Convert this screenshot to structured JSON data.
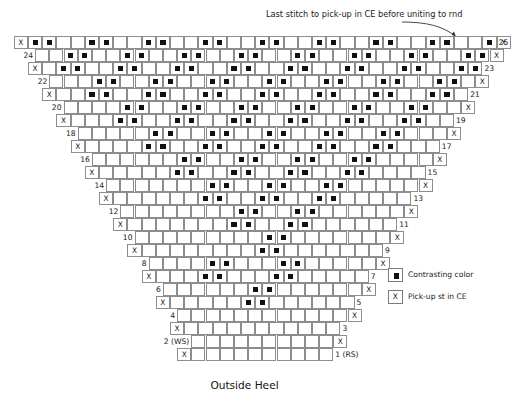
{
  "annotation": {
    "text": "Last stitch to pick-up in CE before uniting to rnd",
    "arrow_icon": "curved-arrow-icon"
  },
  "footer": {
    "label": "Outside Heel"
  },
  "legend": {
    "items": [
      {
        "symbol": "filled-square",
        "label": "Contrasting color"
      },
      {
        "symbol": "X",
        "label": "Pick-up st in CE"
      }
    ]
  },
  "colors": {
    "grid_line": "#8d8d8d",
    "dot": "#111111",
    "background": "#ffffff",
    "text": "#1a1a1a"
  },
  "chart_data": {
    "type": "table",
    "title": "Outside Heel",
    "rows": 25,
    "columns_top": 33,
    "cell_width": 14.2,
    "cell_height": 13,
    "row_side_labels": {
      "left_even": [
        24,
        22,
        20,
        18,
        16,
        14,
        12,
        10,
        8,
        6,
        4,
        "2 (WS)"
      ],
      "right_odd": [
        25,
        23,
        21,
        19,
        17,
        15,
        13,
        11,
        9,
        7,
        5,
        3,
        "1 (RS)"
      ]
    },
    "x_marks": {
      "left_rows": [
        25,
        23,
        21,
        19,
        17,
        15,
        13,
        11,
        9,
        7,
        5,
        3,
        1
      ],
      "right_rows": [
        25,
        24,
        22,
        20,
        18,
        16,
        14,
        12,
        10,
        8,
        6,
        4,
        2
      ]
    },
    "pattern": "chevron repeat, period 7 columns, pairs of dots shifting one column per two rows",
    "rows_data": [
      {
        "row": 25,
        "left_label": "",
        "right_label": "25",
        "x_left": true,
        "x_right": true,
        "width": 33,
        "dots": [
          0,
          1,
          4,
          5,
          8,
          9,
          12,
          13,
          16,
          17,
          20,
          21,
          24,
          25,
          28,
          29,
          32
        ]
      },
      {
        "row": 24,
        "left_label": "24",
        "right_label": "",
        "x_left": false,
        "x_right": true,
        "width": 32,
        "dots": [
          2,
          3,
          6,
          7,
          10,
          11,
          14,
          15,
          18,
          19,
          22,
          23,
          26,
          27,
          30,
          31
        ]
      },
      {
        "row": 23,
        "left_label": "",
        "right_label": "23",
        "x_left": true,
        "x_right": false,
        "width": 31,
        "dots": [
          1,
          2,
          5,
          6,
          9,
          10,
          13,
          14,
          17,
          18,
          21,
          22,
          25,
          26,
          29,
          30
        ]
      },
      {
        "row": 22,
        "left_label": "22",
        "right_label": "",
        "x_left": false,
        "x_right": true,
        "width": 30,
        "dots": [
          3,
          4,
          7,
          8,
          11,
          12,
          15,
          16,
          19,
          20,
          23,
          24,
          27,
          28
        ]
      },
      {
        "row": 21,
        "left_label": "",
        "right_label": "21",
        "x_left": true,
        "x_right": false,
        "width": 29,
        "dots": [
          2,
          3,
          6,
          7,
          10,
          11,
          14,
          15,
          18,
          19,
          22,
          23,
          26,
          27
        ]
      },
      {
        "row": 20,
        "left_label": "20",
        "right_label": "",
        "x_left": false,
        "x_right": true,
        "width": 28,
        "dots": [
          4,
          5,
          8,
          9,
          12,
          13,
          16,
          17,
          20,
          21,
          24,
          25
        ]
      },
      {
        "row": 19,
        "left_label": "",
        "right_label": "19",
        "x_left": true,
        "x_right": false,
        "width": 27,
        "dots": [
          3,
          4,
          7,
          8,
          11,
          12,
          15,
          16,
          19,
          20,
          23,
          24
        ]
      },
      {
        "row": 18,
        "left_label": "18",
        "right_label": "",
        "x_left": false,
        "x_right": true,
        "width": 26,
        "dots": [
          5,
          6,
          9,
          10,
          13,
          14,
          17,
          18,
          21,
          22
        ]
      },
      {
        "row": 17,
        "left_label": "",
        "right_label": "17",
        "x_left": true,
        "x_right": false,
        "width": 25,
        "dots": [
          4,
          5,
          8,
          9,
          12,
          13,
          16,
          17,
          20,
          21
        ]
      },
      {
        "row": 16,
        "left_label": "16",
        "right_label": "",
        "x_left": false,
        "x_right": true,
        "width": 24,
        "dots": [
          6,
          7,
          10,
          11,
          14,
          15,
          18,
          19
        ]
      },
      {
        "row": 15,
        "left_label": "",
        "right_label": "15",
        "x_left": true,
        "x_right": false,
        "width": 23,
        "dots": [
          5,
          6,
          9,
          10,
          13,
          14,
          17,
          18
        ]
      },
      {
        "row": 14,
        "left_label": "14",
        "right_label": "",
        "x_left": false,
        "x_right": true,
        "width": 22,
        "dots": [
          7,
          8,
          11,
          12,
          15,
          16
        ]
      },
      {
        "row": 13,
        "left_label": "",
        "right_label": "13",
        "x_left": true,
        "x_right": false,
        "width": 21,
        "dots": [
          6,
          7,
          10,
          11,
          14,
          15
        ]
      },
      {
        "row": 12,
        "left_label": "12",
        "right_label": "",
        "x_left": false,
        "x_right": true,
        "width": 20,
        "dots": [
          8,
          9,
          12,
          13
        ]
      },
      {
        "row": 11,
        "left_label": "",
        "right_label": "11",
        "x_left": true,
        "x_right": false,
        "width": 19,
        "dots": [
          7,
          8,
          11,
          12
        ]
      },
      {
        "row": 10,
        "left_label": "10",
        "right_label": "",
        "x_left": false,
        "x_right": true,
        "width": 18,
        "dots": [
          9,
          10
        ]
      },
      {
        "row": 9,
        "left_label": "",
        "right_label": "9",
        "x_left": true,
        "x_right": false,
        "width": 17,
        "dots": [
          8,
          9
        ]
      },
      {
        "row": 8,
        "left_label": "8",
        "right_label": "",
        "x_left": false,
        "x_right": true,
        "width": 16,
        "dots": [
          4,
          5,
          9,
          10
        ]
      },
      {
        "row": 7,
        "left_label": "",
        "right_label": "7",
        "x_left": true,
        "x_right": false,
        "width": 15,
        "dots": [
          3,
          4,
          8,
          9
        ]
      },
      {
        "row": 6,
        "left_label": "6",
        "right_label": "",
        "x_left": false,
        "x_right": true,
        "width": 14,
        "dots": [
          6,
          7
        ]
      },
      {
        "row": 5,
        "left_label": "",
        "right_label": "5",
        "x_left": true,
        "x_right": false,
        "width": 13,
        "dots": [
          5,
          6
        ]
      },
      {
        "row": 4,
        "left_label": "4",
        "right_label": "",
        "x_left": false,
        "x_right": true,
        "width": 12,
        "dots": []
      },
      {
        "row": 3,
        "left_label": "",
        "right_label": "3",
        "x_left": true,
        "x_right": false,
        "width": 11,
        "dots": []
      },
      {
        "row": 2,
        "left_label": "2 (WS)",
        "right_label": "",
        "x_left": false,
        "x_right": true,
        "width": 10,
        "dots": []
      },
      {
        "row": 1,
        "left_label": "",
        "right_label": "1 (RS)",
        "x_left": true,
        "x_right": false,
        "width": 10,
        "dots": []
      }
    ]
  }
}
